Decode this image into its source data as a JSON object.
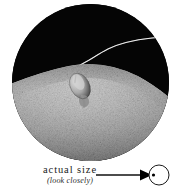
{
  "figure": {
    "name": "magnified-specimen-figure",
    "background_color": "#ffffff",
    "photo": {
      "name": "circular-microphotograph",
      "shape": "circle",
      "description_alt": "tick on skin with hair",
      "background_color": "#050505",
      "skin_highlight_color": "#d8d8d8",
      "skin_shadow_color": "#3a3a3a",
      "specimen_color": "#c9c9c9",
      "hair_color": "#e8e8e8"
    },
    "caption": {
      "main_label": "actual size",
      "sub_label": "(look closely)"
    },
    "pointer": {
      "name": "leader-arrow",
      "line_color": "#111111",
      "target_circle_label": "",
      "target_circle_stroke": "#1a1a1a",
      "dot_color": "#000000"
    }
  }
}
